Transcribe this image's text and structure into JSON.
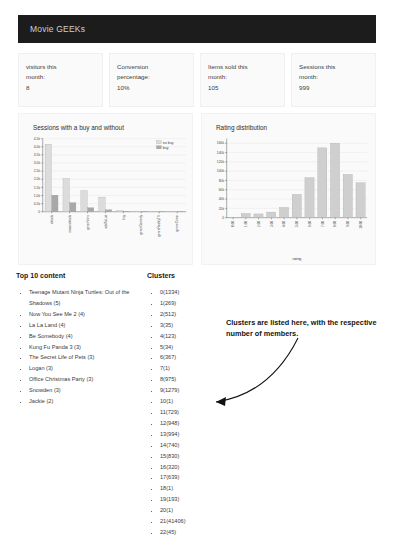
{
  "header": {
    "title": "Movie GEEKs"
  },
  "stats": [
    {
      "label_line1": "visitors this",
      "label_line2": "month:",
      "value": "8"
    },
    {
      "label_line1": "Conversion",
      "label_line2": "percentage:",
      "value": "10%"
    },
    {
      "label_line1": "Items sold this",
      "label_line2": "month:",
      "value": "105"
    },
    {
      "label_line1": "Sessions this",
      "label_line2": "month:",
      "value": "999"
    }
  ],
  "lists": {
    "top_content_title": "Top 10 content",
    "clusters_title": "Clusters",
    "top_content": [
      "Teenage Mutant Ninja Turtles: Out of the Shadows (5)",
      "Now You See Me 2 (4)",
      "La La Land (4)",
      "Be Somebody (4)",
      "Kung Fu Panda 3 (3)",
      "The Secret Life of Pets (3)",
      "Logan (3)",
      "Office Christmas Party (3)",
      "Snowden (3)",
      "Jackie (2)"
    ],
    "clusters": [
      "0(1334)",
      "1(269)",
      "2(512)",
      "3(35)",
      "4(123)",
      "5(34)",
      "6(367)",
      "7(1)",
      "8(975)",
      "9(1279)",
      "10(1)",
      "11(729)",
      "12(948)",
      "13(994)",
      "14(740)",
      "15(830)",
      "16(320)",
      "17(639)",
      "18(1)",
      "19(193)",
      "20(1)",
      "21(41406)",
      "22(45)"
    ]
  },
  "annotation": {
    "text": "Clusters are listed here, with the respective number of members."
  },
  "colors": {
    "header_bg": "#1c1c1c",
    "card_bg": "#fafafa",
    "bar_light": "#d9d9d9",
    "bar_dark": "#a8a8a8",
    "grid": "#e3e3e3"
  },
  "chart_data": [
    {
      "type": "bar",
      "title": "Sessions with a buy and without",
      "xlabel": "",
      "ylabel": "",
      "ylim": [
        0,
        4500
      ],
      "ytick_labels": [
        "0",
        "0.5k",
        "1.0k",
        "1.5k",
        "2.0k",
        "2.5k",
        "3.0k",
        "3.5k",
        "4.0k",
        "4.5k"
      ],
      "ytick_values": [
        0,
        500,
        1000,
        1500,
        2000,
        2500,
        3000,
        3500,
        4000,
        4500
      ],
      "grid": true,
      "legend_position": "top-right",
      "categories": [
        "details",
        "moviedetails",
        "genreView",
        "addToList",
        "buy",
        "genreComedy",
        "genreRealityTV",
        "genreCrime"
      ],
      "series": [
        {
          "name": "no buy",
          "color": "#dcdcdc",
          "values": [
            4150,
            2050,
            1300,
            900,
            70,
            40,
            30,
            25
          ]
        },
        {
          "name": "buy",
          "color": "#a8a8a8",
          "values": [
            1020,
            560,
            250,
            120,
            30,
            15,
            12,
            10
          ]
        }
      ]
    },
    {
      "type": "bar",
      "title": "Rating distribution",
      "xlabel": "rating",
      "ylabel": "",
      "ylim": [
        0,
        170000
      ],
      "ytick_labels": [
        "0",
        "20k",
        "40k",
        "60k",
        "80k",
        "100k",
        "120k",
        "140k",
        "160k"
      ],
      "ytick_values": [
        0,
        20000,
        40000,
        60000,
        80000,
        100000,
        120000,
        140000,
        160000
      ],
      "grid": true,
      "categories": [
        "0.00",
        "1.00",
        "2.00",
        "3.00",
        "4.00",
        "5.00",
        "6.00",
        "7.00",
        "8.00",
        "9.00",
        "10.00"
      ],
      "values": [
        1000,
        9000,
        8000,
        12000,
        22000,
        50000,
        86000,
        150000,
        160000,
        93000,
        75000
      ],
      "bar_color": "#cfcfcf"
    }
  ]
}
